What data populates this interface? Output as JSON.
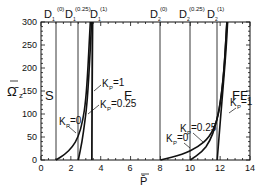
{
  "chart_data": {
    "type": "line",
    "title": "",
    "xlabel": "P̄",
    "ylabel": "Ω̄z",
    "xlim": [
      0,
      14
    ],
    "ylim": [
      0,
      300
    ],
    "x_ticks": [
      0,
      2,
      4,
      6,
      8,
      10,
      12,
      14
    ],
    "y_ticks": [
      0,
      50,
      100,
      150,
      200,
      250,
      300
    ],
    "grid": false,
    "legend": "inline labels",
    "regions": [
      "S",
      "F",
      "FF"
    ],
    "vertical_lines": [
      {
        "label": "D1(0)",
        "x": 1.0
      },
      {
        "label": "D1(0.25)",
        "x": 2.5
      },
      {
        "label": "D1(1)",
        "x": 3.4
      },
      {
        "label": "D2(0)",
        "x": 8.0
      },
      {
        "label": "D2(0.25)",
        "x": 10.0
      },
      {
        "label": "D2(1)",
        "x": 11.8
      }
    ],
    "series": [
      {
        "name": "Kp=0 (S-F)",
        "x": [
          1.0,
          1.6,
          2.1,
          2.5,
          2.8,
          3.0,
          3.15,
          3.3
        ],
        "y": [
          0,
          12,
          28,
          50,
          85,
          130,
          200,
          300
        ]
      },
      {
        "name": "Kp=0.25 (S-F)",
        "x": [
          2.5,
          2.75,
          2.95,
          3.1,
          3.2,
          3.3,
          3.38
        ],
        "y": [
          0,
          40,
          85,
          130,
          180,
          240,
          300
        ]
      },
      {
        "name": "Kp=1 (S-F)",
        "x": [
          3.4,
          3.42,
          3.44,
          3.46
        ],
        "y": [
          0,
          100,
          200,
          300
        ]
      },
      {
        "name": "Kp=0 (F-FF)",
        "x": [
          8.0,
          9.5,
          10.5,
          11.3,
          11.8,
          12.1,
          12.3,
          12.45
        ],
        "y": [
          0,
          12,
          28,
          50,
          85,
          140,
          210,
          300
        ]
      },
      {
        "name": "Kp=0.25 (F-FF)",
        "x": [
          10.0,
          10.8,
          11.3,
          11.7,
          12.0,
          12.25,
          12.45
        ],
        "y": [
          0,
          18,
          40,
          75,
          120,
          190,
          300
        ]
      },
      {
        "name": "Kp=1 (F-FF)",
        "x": [
          11.8,
          11.95,
          12.1,
          12.25,
          12.4,
          12.5
        ],
        "y": [
          0,
          60,
          120,
          180,
          240,
          300
        ]
      }
    ],
    "annotations": [
      {
        "text": "Kp=1",
        "x": 4.2,
        "y": 150
      },
      {
        "text": "Kp=0.25",
        "x": 4.2,
        "y": 100
      },
      {
        "text": "Kp=0",
        "x": 1.5,
        "y": 65
      },
      {
        "text": "Kp=0.25",
        "x": 9.8,
        "y": 60
      },
      {
        "text": "Kp=0",
        "x": 8.7,
        "y": 30
      },
      {
        "text": "Kp=1",
        "x": 12.6,
        "y": 85
      }
    ]
  },
  "labels": {
    "y_axis": "Ω̄",
    "y_axis_sub": "z",
    "x_axis": "P̄",
    "region_s": "S",
    "region_f": "F",
    "region_ff": "FF",
    "d1_0": "D",
    "d1_0_sub": "1",
    "d1_0_sup": "(0)",
    "d1_025": "D",
    "d1_025_sub": "1",
    "d1_025_sup": "(0.25)",
    "d1_1": "D",
    "d1_1_sub": "1",
    "d1_1_sup": "(1)",
    "d2_0": "D",
    "d2_0_sub": "2",
    "d2_0_sup": "(0)",
    "d2_025": "D",
    "d2_025_sub": "2",
    "d2_025_sup": "(0.25)",
    "d2_1": "D",
    "d2_1_sub": "2",
    "d2_1_sup": "(1)",
    "kp": "K",
    "kp_sub": "P",
    "kp1": "=1",
    "kp025": "=0.25",
    "kp0": "=0",
    "x_ticks": [
      "0",
      "2",
      "4",
      "6",
      "8",
      "10",
      "12",
      "14"
    ],
    "y_ticks": [
      "0",
      "50",
      "100",
      "150",
      "200",
      "250",
      "300"
    ]
  }
}
